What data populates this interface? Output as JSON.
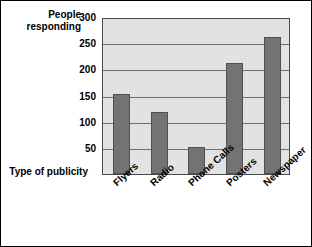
{
  "chart_data": {
    "type": "bar",
    "title": "",
    "categories": [
      "Flyers",
      "Radio",
      "Phone Calls",
      "Posters",
      "Newspaper"
    ],
    "values": [
      152,
      118,
      52,
      212,
      262
    ],
    "xlabel": "Type of publicity",
    "ylabel": "People\nresponding",
    "ylim": [
      0,
      300
    ],
    "ytick_labels": [
      "300",
      "250",
      "200",
      "150",
      "100",
      "50"
    ],
    "ytick_values": [
      300,
      250,
      200,
      150,
      100,
      50
    ],
    "grid": true,
    "legend": null,
    "colors": {
      "bar_fill": "#737373",
      "bar_edge": "#4f4f4f",
      "plot_background": "#e2e2e2",
      "gridline": "#6f6f6f",
      "frame": "#000000",
      "text": "#000000"
    }
  }
}
